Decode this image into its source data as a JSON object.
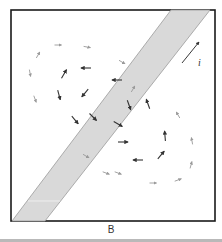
{
  "figure": {
    "caption": "B",
    "current_label": "i",
    "colors": {
      "frame": "#1a1a1a",
      "band_fill": "#d9d9d9",
      "band_edge": "#9a9a9a",
      "arrow_dark": "#333333",
      "arrow_light": "#9a9a9a",
      "baseline": "#b9b9b9"
    },
    "frame": {
      "x": 11,
      "y": 10,
      "w": 204,
      "h": 211
    },
    "band": {
      "points": "171,10 210,10 45,221 12,221"
    },
    "current_arrow": {
      "x1": 182,
      "y1": 63,
      "x2": 199,
      "y2": 42
    },
    "field_arrows": [
      {
        "x": 38,
        "y": 55,
        "angle": -60,
        "tone": "light"
      },
      {
        "x": 58,
        "y": 45,
        "angle": 0,
        "tone": "light"
      },
      {
        "x": 87,
        "y": 47,
        "angle": 10,
        "tone": "light"
      },
      {
        "x": 30,
        "y": 73,
        "angle": 80,
        "tone": "light"
      },
      {
        "x": 64,
        "y": 74,
        "angle": -60,
        "tone": "dark"
      },
      {
        "x": 86,
        "y": 68,
        "angle": 180,
        "tone": "dark"
      },
      {
        "x": 35,
        "y": 99,
        "angle": 70,
        "tone": "light"
      },
      {
        "x": 59,
        "y": 95,
        "angle": 75,
        "tone": "dark"
      },
      {
        "x": 85,
        "y": 93,
        "angle": 130,
        "tone": "dark"
      },
      {
        "x": 93,
        "y": 117,
        "angle": 45,
        "tone": "dark"
      },
      {
        "x": 75,
        "y": 120,
        "angle": 50,
        "tone": "dark"
      },
      {
        "x": 122,
        "y": 62,
        "angle": 30,
        "tone": "light"
      },
      {
        "x": 117,
        "y": 80,
        "angle": 180,
        "tone": "dark"
      },
      {
        "x": 133,
        "y": 89,
        "angle": -60,
        "tone": "light"
      },
      {
        "x": 148,
        "y": 104,
        "angle": -110,
        "tone": "dark"
      },
      {
        "x": 178,
        "y": 115,
        "angle": -120,
        "tone": "light"
      },
      {
        "x": 123,
        "y": 142,
        "angle": 0,
        "tone": "dark"
      },
      {
        "x": 165,
        "y": 136,
        "angle": -95,
        "tone": "dark"
      },
      {
        "x": 192,
        "y": 141,
        "angle": -100,
        "tone": "light"
      },
      {
        "x": 138,
        "y": 160,
        "angle": 180,
        "tone": "dark"
      },
      {
        "x": 161,
        "y": 155,
        "angle": -50,
        "tone": "dark"
      },
      {
        "x": 191,
        "y": 165,
        "angle": -75,
        "tone": "light"
      },
      {
        "x": 118,
        "y": 173,
        "angle": 20,
        "tone": "light"
      },
      {
        "x": 153,
        "y": 183,
        "angle": 0,
        "tone": "light"
      },
      {
        "x": 178,
        "y": 180,
        "angle": -20,
        "tone": "light"
      },
      {
        "x": 86,
        "y": 156,
        "angle": 30,
        "tone": "light"
      },
      {
        "x": 118,
        "y": 124,
        "angle": 30,
        "tone": "dark"
      },
      {
        "x": 106,
        "y": 173,
        "angle": 20,
        "tone": "light"
      },
      {
        "x": 129,
        "y": 105,
        "angle": 70,
        "tone": "dark"
      }
    ]
  }
}
